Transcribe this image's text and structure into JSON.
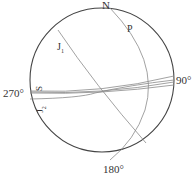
{
  "diagram": {
    "type": "stereonet",
    "colors": {
      "circle": "#444444",
      "lines": "#8a8a8a",
      "text": "#333333"
    },
    "labels": {
      "north": "N",
      "east": "90°",
      "south": "180°",
      "west": "270°",
      "plane_p": "P",
      "plane_j1": "J",
      "plane_j1_sub": "1",
      "plane_s": "S",
      "plane_j2": "J",
      "plane_j2_sub": "2"
    }
  }
}
